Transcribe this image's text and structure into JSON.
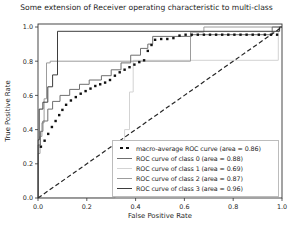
{
  "title": "Some extension of Receiver operating characteristic to multi-class",
  "chart_data": {
    "type": "line",
    "title": "Some extension of Receiver operating characteristic to multi-class",
    "xlabel": "False Positive Rate",
    "ylabel": "True Positive Rate",
    "xlim": [
      0.0,
      1.0
    ],
    "ylim": [
      0.0,
      1.02
    ],
    "xticks": [
      "0.0",
      "0.2",
      "0.4",
      "0.6",
      "0.8",
      "1.0"
    ],
    "yticks": [
      "0.0",
      "0.2",
      "0.4",
      "0.6",
      "0.8",
      "1.0"
    ],
    "grid": false,
    "legend_position": "lower right",
    "series": [
      {
        "name": "macro-average ROC curve (area = 0.86)",
        "area": 0.86,
        "style": "dotted-squares",
        "color": "#111111",
        "points": [
          [
            0.012,
            0.3
          ],
          [
            0.027,
            0.335
          ],
          [
            0.042,
            0.375
          ],
          [
            0.057,
            0.415
          ],
          [
            0.072,
            0.45
          ],
          [
            0.087,
            0.485
          ],
          [
            0.1,
            0.515
          ],
          [
            0.115,
            0.545
          ],
          [
            0.135,
            0.57
          ],
          [
            0.155,
            0.59
          ],
          [
            0.175,
            0.61
          ],
          [
            0.195,
            0.625
          ],
          [
            0.215,
            0.64
          ],
          [
            0.235,
            0.655
          ],
          [
            0.255,
            0.665
          ],
          [
            0.275,
            0.675
          ],
          [
            0.295,
            0.69
          ],
          [
            0.315,
            0.715
          ],
          [
            0.335,
            0.735
          ],
          [
            0.355,
            0.75
          ],
          [
            0.375,
            0.765
          ],
          [
            0.395,
            0.78
          ],
          [
            0.415,
            0.795
          ],
          [
            0.435,
            0.805
          ],
          [
            0.45,
            0.86
          ],
          [
            0.465,
            0.895
          ],
          [
            0.48,
            0.925
          ],
          [
            0.505,
            0.93
          ],
          [
            0.53,
            0.93
          ],
          [
            0.555,
            0.935
          ],
          [
            0.58,
            0.95
          ],
          [
            0.605,
            0.955
          ],
          [
            0.63,
            0.955
          ],
          [
            0.655,
            0.955
          ],
          [
            0.68,
            0.955
          ],
          [
            0.705,
            0.955
          ],
          [
            0.73,
            0.955
          ],
          [
            0.755,
            0.955
          ],
          [
            0.78,
            0.955
          ],
          [
            0.805,
            0.955
          ],
          [
            0.83,
            0.955
          ],
          [
            0.855,
            0.955
          ],
          [
            0.88,
            0.955
          ],
          [
            0.905,
            0.955
          ],
          [
            0.93,
            0.955
          ],
          [
            0.955,
            0.955
          ],
          [
            0.98,
            0.955
          ]
        ]
      },
      {
        "name": "ROC curve of class 0 (area = 0.88)",
        "area": 0.88,
        "style": "step",
        "color": "#6f6f6f",
        "points": [
          [
            0,
            0
          ],
          [
            0,
            0.31
          ],
          [
            0.01,
            0.31
          ],
          [
            0.01,
            0.39
          ],
          [
            0.02,
            0.39
          ],
          [
            0.02,
            0.45
          ],
          [
            0.04,
            0.45
          ],
          [
            0.04,
            0.52
          ],
          [
            0.06,
            0.52
          ],
          [
            0.06,
            0.565
          ],
          [
            0.09,
            0.565
          ],
          [
            0.09,
            0.6
          ],
          [
            0.13,
            0.6
          ],
          [
            0.13,
            0.635
          ],
          [
            0.17,
            0.635
          ],
          [
            0.17,
            0.665
          ],
          [
            0.21,
            0.665
          ],
          [
            0.21,
            0.69
          ],
          [
            0.26,
            0.69
          ],
          [
            0.26,
            0.715
          ],
          [
            0.3,
            0.715
          ],
          [
            0.3,
            0.75
          ],
          [
            0.34,
            0.75
          ],
          [
            0.34,
            0.79
          ],
          [
            0.38,
            0.79
          ],
          [
            0.38,
            0.835
          ],
          [
            0.42,
            0.835
          ],
          [
            0.42,
            0.875
          ],
          [
            0.45,
            0.875
          ],
          [
            0.45,
            0.9
          ],
          [
            0.47,
            0.9
          ],
          [
            0.47,
            0.945
          ],
          [
            0.63,
            0.945
          ],
          [
            0.63,
            0.955
          ],
          [
            0.96,
            0.955
          ],
          [
            0.96,
            1
          ],
          [
            1,
            1
          ]
        ]
      },
      {
        "name": "ROC curve of class 1 (area = 0.69)",
        "area": 0.69,
        "style": "step",
        "color": "#d3d3d3",
        "points": [
          [
            0,
            0
          ],
          [
            0.315,
            0
          ],
          [
            0.315,
            0.21
          ],
          [
            0.355,
            0.21
          ],
          [
            0.355,
            0.4
          ],
          [
            0.375,
            0.4
          ],
          [
            0.375,
            0.62
          ],
          [
            0.39,
            0.62
          ],
          [
            0.39,
            0.805
          ],
          [
            0.985,
            0.805
          ],
          [
            0.985,
            1
          ],
          [
            1,
            1
          ]
        ]
      },
      {
        "name": "ROC curve of class 2 (area = 0.87)",
        "area": 0.87,
        "style": "step",
        "color": "#9c9c9c",
        "points": [
          [
            0,
            0
          ],
          [
            0,
            0.26
          ],
          [
            0.008,
            0.26
          ],
          [
            0.008,
            0.36
          ],
          [
            0.016,
            0.36
          ],
          [
            0.016,
            0.44
          ],
          [
            0.025,
            0.44
          ],
          [
            0.025,
            0.58
          ],
          [
            0.035,
            0.58
          ],
          [
            0.035,
            0.79
          ],
          [
            0.05,
            0.79
          ],
          [
            0.05,
            0.8
          ],
          [
            0.625,
            0.8
          ],
          [
            0.625,
            0.97
          ],
          [
            0.68,
            0.97
          ],
          [
            0.68,
            1
          ],
          [
            1,
            1
          ]
        ]
      },
      {
        "name": "ROC curve of class 3 (area = 0.96)",
        "area": 0.96,
        "style": "step",
        "color": "#3d3d3d",
        "points": [
          [
            0,
            0
          ],
          [
            0,
            0.34
          ],
          [
            0.005,
            0.34
          ],
          [
            0.005,
            0.52
          ],
          [
            0.02,
            0.52
          ],
          [
            0.02,
            0.56
          ],
          [
            0.04,
            0.56
          ],
          [
            0.04,
            0.65
          ],
          [
            0.06,
            0.65
          ],
          [
            0.06,
            0.72
          ],
          [
            0.08,
            0.72
          ],
          [
            0.08,
            0.975
          ],
          [
            0.99,
            0.975
          ],
          [
            0.99,
            1
          ],
          [
            1,
            1
          ]
        ]
      },
      {
        "name": "chance",
        "style": "dashed",
        "color": "#262626",
        "points": [
          [
            0,
            0
          ],
          [
            1,
            1
          ]
        ]
      }
    ]
  }
}
